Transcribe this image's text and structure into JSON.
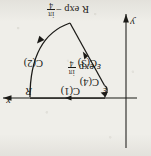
{
  "figure": {
    "orientation": "rotated-180",
    "ink_color": "#1b1a17",
    "paper_color": "#efeee9",
    "axes": {
      "x_label": "x",
      "y_label": "y",
      "x_axis_direction": "right",
      "y_axis_direction": "down"
    },
    "points": {
      "inner_radius_label": "ε",
      "outer_radius_label": "R"
    },
    "contour_labels": {
      "c1": "C(1)",
      "c2": "C(2)",
      "c3": "C(3)",
      "c4": "C(4)"
    },
    "vertex_labels": {
      "outer_arc_end": {
        "base": "R exp ",
        "minus": "−",
        "imag": "iπ",
        "num": "iπ",
        "den": "4"
      },
      "inner_arc_end": {
        "base": "ε exp ",
        "imag": "iπ",
        "num": "iπ",
        "den": "4"
      }
    },
    "vertex_label_text": {
      "outer": "R exp −iπ/4",
      "inner": "ε exp iπ/4"
    }
  }
}
